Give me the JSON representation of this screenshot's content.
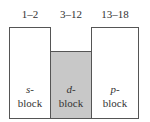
{
  "diagram": {
    "blocks": [
      {
        "group_range": "1–2",
        "name_line1": "s-",
        "name_line2": "block",
        "fill": "#ffffff"
      },
      {
        "group_range": "3–12",
        "name_line1": "d-",
        "name_line2": "block",
        "fill": "#c8c8c8"
      },
      {
        "group_range": "13–18",
        "name_line1": "p-",
        "name_line2": "block",
        "fill": "#ffffff"
      }
    ]
  }
}
